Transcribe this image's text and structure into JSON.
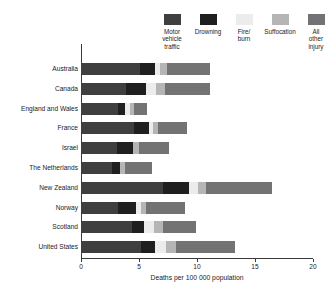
{
  "chart_data": {
    "type": "bar",
    "orientation": "horizontal",
    "stacked": true,
    "title": "",
    "xlabel": "Deaths per 100 000 population",
    "ylabel": "",
    "xlim": [
      0,
      20
    ],
    "xticks": [
      0,
      5,
      10,
      15,
      20
    ],
    "xtick_labels": [
      "0",
      "5",
      "10",
      "15",
      "20"
    ],
    "grid": false,
    "legend_position": "top",
    "categories": [
      "Australia",
      "Canada",
      "England and Wales",
      "France",
      "Israel",
      "The Netherlands",
      "New Zealand",
      "Norway",
      "Scotland",
      "United States"
    ],
    "series": [
      {
        "name": "Motor vehicle traffic",
        "color": "#3f3f3f",
        "values": [
          5.1,
          3.9,
          3.2,
          4.6,
          3.1,
          2.7,
          7.1,
          3.2,
          4.4,
          5.2
        ]
      },
      {
        "name": "Drowning",
        "color": "#1f1f1f",
        "values": [
          1.3,
          1.7,
          0.6,
          1.3,
          1.4,
          0.7,
          2.2,
          1.5,
          1.0,
          1.2
        ]
      },
      {
        "name": "Fire/burn",
        "color": "#ececec",
        "values": [
          0.4,
          0.9,
          0.4,
          0.3,
          0.0,
          0.0,
          0.8,
          0.5,
          0.9,
          0.9
        ]
      },
      {
        "name": "Suffocation",
        "color": "#b5b5b5",
        "values": [
          0.6,
          0.7,
          0.4,
          0.4,
          0.5,
          0.4,
          0.7,
          0.4,
          0.8,
          0.9
        ]
      },
      {
        "name": "All other injury",
        "color": "#737373",
        "values": [
          3.7,
          3.9,
          1.1,
          2.5,
          2.6,
          2.3,
          5.7,
          3.4,
          2.8,
          5.1
        ]
      }
    ]
  },
  "legend": {
    "items": [
      {
        "label": "Motor\nvehicle\ntraffic",
        "color": "#3f3f3f",
        "name": "motor-vehicle-traffic"
      },
      {
        "label": "Drowning",
        "color": "#1f1f1f",
        "name": "drowning"
      },
      {
        "label": "Fire/\nburn",
        "color": "#ececec",
        "name": "fire-burn"
      },
      {
        "label": "Suffocation",
        "color": "#b5b5b5",
        "name": "suffocation"
      },
      {
        "label": "All\nother\ninjury",
        "color": "#737373",
        "name": "all-other-injury"
      }
    ]
  },
  "axis": {
    "x_title": "Deaths per 100 000 population",
    "x_tick_labels": [
      "0",
      "5",
      "10",
      "15",
      "20"
    ]
  }
}
